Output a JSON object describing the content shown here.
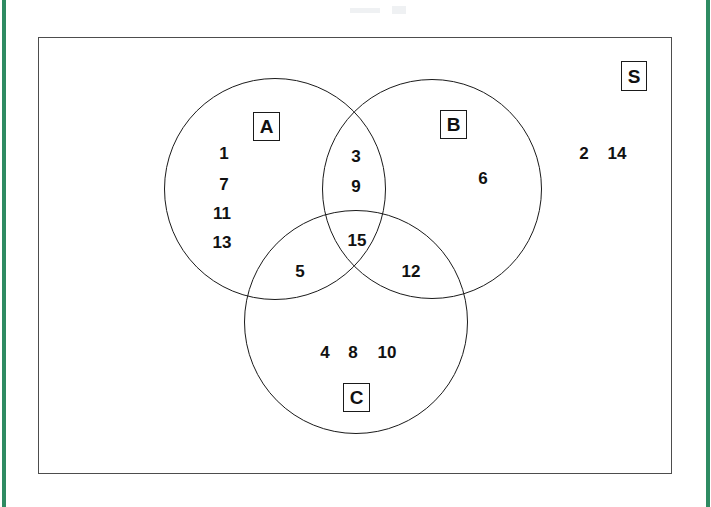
{
  "page": {
    "width": 711,
    "height": 507,
    "background": "#ffffff",
    "margin_rule_color": "#2e8b62",
    "ink_color": "#111111",
    "frame_color": "#4d4d4d"
  },
  "diagram": {
    "kind": "three-set-venn-diagram",
    "universal_set": {
      "label": "S",
      "description": "rectangle enclosing all three circles"
    },
    "sets": [
      {
        "id": "A",
        "label": "A",
        "cx": 275,
        "cy": 189,
        "r": 111
      },
      {
        "id": "B",
        "label": "B",
        "cx": 432,
        "cy": 189,
        "r": 110
      },
      {
        "id": "C",
        "label": "C",
        "cx": 356,
        "cy": 322,
        "r": 112
      }
    ],
    "set_label_positions": [
      {
        "id": "A",
        "label": "A",
        "x": 253,
        "y": 112,
        "w": 27,
        "h": 29
      },
      {
        "id": "B",
        "label": "B",
        "x": 440,
        "y": 110,
        "w": 27,
        "h": 29
      },
      {
        "id": "C",
        "label": "C",
        "x": 343,
        "y": 383,
        "w": 27,
        "h": 29
      },
      {
        "id": "S",
        "label": "S",
        "x": 621,
        "y": 61,
        "w": 26,
        "h": 30
      }
    ],
    "regions": [
      {
        "id": "A-only",
        "name": "A only",
        "members": [
          "1",
          "7",
          "11",
          "13"
        ],
        "layout": "vertical",
        "placements": [
          {
            "text": "1",
            "x": 224,
            "y": 153
          },
          {
            "text": "7",
            "x": 224,
            "y": 184
          },
          {
            "text": "11",
            "x": 222,
            "y": 213
          },
          {
            "text": "13",
            "x": 222,
            "y": 242
          }
        ]
      },
      {
        "id": "B-only",
        "name": "B only",
        "members": [
          "6"
        ],
        "layout": "single",
        "placements": [
          {
            "text": "6",
            "x": 483,
            "y": 178
          }
        ]
      },
      {
        "id": "C-only",
        "name": "C only",
        "members": [
          "4",
          "8",
          "10"
        ],
        "layout": "horizontal",
        "placements": [
          {
            "text": "4",
            "x": 325,
            "y": 352
          },
          {
            "text": "8",
            "x": 353,
            "y": 352
          },
          {
            "text": "10",
            "x": 387,
            "y": 352
          }
        ]
      },
      {
        "id": "A-and-B",
        "name": "A intersect B only",
        "members": [
          "3",
          "9"
        ],
        "layout": "vertical",
        "placements": [
          {
            "text": "3",
            "x": 356,
            "y": 156
          },
          {
            "text": "9",
            "x": 356,
            "y": 186
          }
        ]
      },
      {
        "id": "A-and-C",
        "name": "A intersect C only",
        "members": [
          "5"
        ],
        "layout": "single",
        "placements": [
          {
            "text": "5",
            "x": 300,
            "y": 271
          }
        ]
      },
      {
        "id": "B-and-C",
        "name": "B intersect C only",
        "members": [
          "12"
        ],
        "layout": "single",
        "placements": [
          {
            "text": "12",
            "x": 411,
            "y": 271
          }
        ]
      },
      {
        "id": "A-and-B-and-C",
        "name": "A intersect B intersect C",
        "members": [
          "15"
        ],
        "layout": "single",
        "placements": [
          {
            "text": "15",
            "x": 357,
            "y": 240
          }
        ]
      },
      {
        "id": "outside",
        "name": "inside S but outside A, B and C",
        "members": [
          "2",
          "14"
        ],
        "layout": "horizontal",
        "placements": [
          {
            "text": "2",
            "x": 584,
            "y": 153
          },
          {
            "text": "14",
            "x": 617,
            "y": 153
          }
        ]
      }
    ]
  },
  "chart_data": {
    "type": "diagram",
    "subtype": "venn",
    "title": "",
    "universal_set": "S",
    "sets": [
      "A",
      "B",
      "C"
    ],
    "regions": {
      "A_only": [
        1,
        7,
        11,
        13
      ],
      "B_only": [
        6
      ],
      "C_only": [
        4,
        8,
        10
      ],
      "A_and_B_only": [
        3,
        9
      ],
      "A_and_C_only": [
        5
      ],
      "B_and_C_only": [
        12
      ],
      "A_and_B_and_C": [
        15
      ],
      "outside_all": [
        2,
        14
      ]
    },
    "universe_elements": [
      1,
      2,
      3,
      4,
      5,
      6,
      7,
      8,
      9,
      10,
      11,
      12,
      13,
      14,
      15
    ]
  }
}
